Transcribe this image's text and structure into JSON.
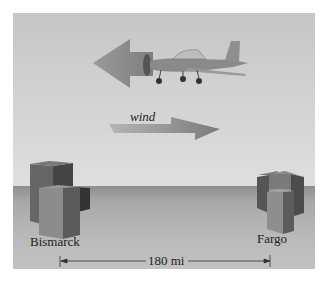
{
  "diagram": {
    "labels": {
      "wind": "wind",
      "left_city": "Bismarck",
      "right_city": "Fargo",
      "distance": "180 mi"
    },
    "elements": [
      "airplane-icon",
      "plane-velocity-arrow",
      "wind-arrow",
      "bismarck-buildings",
      "fargo-buildings",
      "distance-dimension-line"
    ],
    "colors": {
      "sky": "#d4d4d4",
      "ground": "#a8a8a8",
      "arrow": "#8c8c8c",
      "building_dark": "#555555",
      "building_light": "#8a8a8a"
    }
  }
}
